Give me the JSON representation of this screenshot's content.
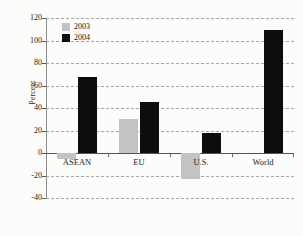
{
  "chart_data": {
    "type": "bar",
    "title": "",
    "xlabel": "",
    "ylabel": "Percent",
    "categories": [
      "ASEAN",
      "EU",
      "U.S.",
      "World"
    ],
    "series": [
      {
        "name": "2003",
        "color": "#c3c3c3",
        "values": [
          -5,
          30,
          -23,
          0
        ]
      },
      {
        "name": "2004",
        "color": "#0d0d0d",
        "values": [
          68,
          45,
          18,
          109
        ]
      }
    ],
    "ylim": [
      -40,
      120
    ],
    "yticks": [
      120,
      100,
      80,
      60,
      40,
      20,
      0,
      -20,
      -40
    ],
    "ytick_labels": [
      "120",
      "100",
      "80",
      "60",
      "40",
      "20",
      "0",
      "-20",
      "-40"
    ],
    "grid": true,
    "legend_position": "top-left",
    "background_color": "#fcfcfa",
    "gridline_color": "#9a9a9a",
    "axis_color": "#8b8b8b"
  }
}
